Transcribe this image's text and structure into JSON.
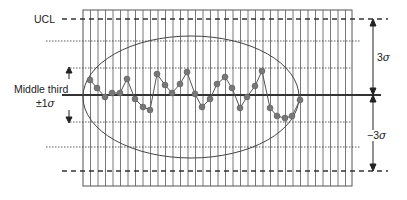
{
  "diagram": {
    "type": "control-chart",
    "labels": {
      "ucl": "UCL",
      "middle_third_line1": "Middle third",
      "middle_third_pm": "±1",
      "sigma": "σ",
      "upper_span": "3",
      "lower_span": "−3"
    },
    "colors": {
      "line": "#333333",
      "grid": "#555555",
      "point": "#777777",
      "background": "#ffffff"
    },
    "grid": {
      "left": 83,
      "right": 352,
      "top": 10,
      "bottom": 186,
      "vertical_spacing": 7.5
    },
    "horizontal_lines": [
      {
        "name": "ucl",
        "y": 19,
        "style": "dashed",
        "x1": 62,
        "x2": 388
      },
      {
        "name": "plus-2-sigma",
        "y": 41,
        "style": "dotted",
        "x1": 46,
        "x2": 360
      },
      {
        "name": "plus-1-sigma",
        "y": 68,
        "style": "dotted",
        "x1": 70,
        "x2": 352
      },
      {
        "name": "center",
        "y": 95,
        "style": "solid",
        "x1": 62,
        "x2": 381
      },
      {
        "name": "minus-1-sigma",
        "y": 122,
        "style": "dotted",
        "x1": 70,
        "x2": 352
      },
      {
        "name": "minus-2-sigma",
        "y": 147,
        "style": "dotted",
        "x1": 46,
        "x2": 360
      },
      {
        "name": "lcl",
        "y": 171,
        "style": "dashed",
        "x1": 62,
        "x2": 388
      }
    ],
    "ellipse": {
      "cx": 191,
      "cy": 97,
      "rx": 108,
      "ry": 61
    },
    "points": [
      [
        90,
        80
      ],
      [
        97,
        88
      ],
      [
        105,
        97
      ],
      [
        112,
        93
      ],
      [
        120,
        93
      ],
      [
        127,
        79
      ],
      [
        135,
        99
      ],
      [
        143,
        107
      ],
      [
        150,
        110
      ],
      [
        157,
        74
      ],
      [
        165,
        85
      ],
      [
        172,
        93
      ],
      [
        180,
        84
      ],
      [
        187,
        72
      ],
      [
        195,
        94
      ],
      [
        202,
        107
      ],
      [
        210,
        99
      ],
      [
        217,
        84
      ],
      [
        225,
        77
      ],
      [
        232,
        88
      ],
      [
        240,
        108
      ],
      [
        247,
        97
      ],
      [
        255,
        86
      ],
      [
        262,
        71
      ],
      [
        270,
        108
      ],
      [
        277,
        116
      ],
      [
        285,
        118
      ],
      [
        292,
        116
      ],
      [
        300,
        100
      ]
    ]
  }
}
